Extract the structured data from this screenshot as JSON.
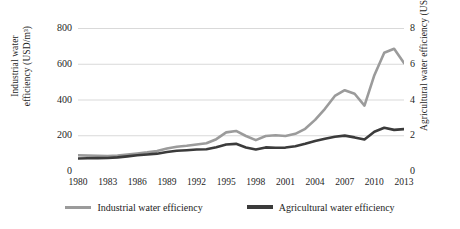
{
  "chart_data": {
    "type": "line",
    "title": "",
    "xlabel": "",
    "ylabel": "Industrial water efficiency (USD/m³)",
    "y2label": "Agricultural water efficiency (USD/m³)",
    "grid": true,
    "legend_position": "bottom",
    "x": [
      1980,
      1981,
      1982,
      1983,
      1984,
      1985,
      1986,
      1987,
      1988,
      1989,
      1990,
      1991,
      1992,
      1993,
      1994,
      1995,
      1996,
      1997,
      1998,
      1999,
      2000,
      2001,
      2002,
      2003,
      2004,
      2005,
      2006,
      2007,
      2008,
      2009,
      2010,
      2011,
      2012,
      2013
    ],
    "xtick_labels": [
      "1980",
      "1983",
      "1986",
      "1989",
      "1992",
      "1995",
      "1998",
      "2001",
      "2004",
      "2007",
      "2010",
      "2013"
    ],
    "xtick_values": [
      1980,
      1983,
      1986,
      1989,
      1992,
      1995,
      1998,
      2001,
      2004,
      2007,
      2010,
      2013
    ],
    "xlim": [
      1980,
      2013
    ],
    "ylim": [
      0,
      800
    ],
    "ytick_labels": [
      "0",
      "200",
      "400",
      "600",
      "800"
    ],
    "ytick_values": [
      0,
      200,
      400,
      600,
      800
    ],
    "y2lim": [
      0,
      8
    ],
    "y2tick_labels": [
      "0",
      "2",
      "4",
      "6",
      "8"
    ],
    "y2tick_values": [
      0,
      2,
      4,
      6,
      8
    ],
    "series": [
      {
        "name": "Industrial water efficiency",
        "axis": "left",
        "color": "#9b9b9b",
        "width": 2.6,
        "values": [
          88,
          86,
          85,
          84,
          86,
          92,
          98,
          104,
          112,
          126,
          136,
          141,
          148,
          155,
          178,
          216,
          224,
          196,
          173,
          196,
          200,
          196,
          208,
          236,
          286,
          348,
          420,
          452,
          432,
          366,
          536,
          662,
          684,
          604
        ]
      },
      {
        "name": "Agricultural water efficiency",
        "axis": "right",
        "color": "#3b3b3b",
        "width": 2.6,
        "values": [
          0.7,
          0.71,
          0.72,
          0.73,
          0.76,
          0.82,
          0.88,
          0.92,
          0.97,
          1.06,
          1.13,
          1.16,
          1.2,
          1.22,
          1.33,
          1.48,
          1.52,
          1.32,
          1.2,
          1.32,
          1.3,
          1.31,
          1.38,
          1.52,
          1.68,
          1.8,
          1.92,
          1.98,
          1.88,
          1.76,
          2.2,
          2.42,
          2.3,
          2.34
        ]
      }
    ]
  },
  "legend": {
    "items": [
      {
        "label": "Industrial water efficiency",
        "color": "#9b9b9b"
      },
      {
        "label": "Agricultural water efficiency",
        "color": "#3b3b3b"
      }
    ]
  },
  "axes": {
    "left_title_line1": "Industrial water",
    "left_title_line2": "efficiency (USD/m³)",
    "right_title": "Agricultural water efficiency (USD/m³)"
  }
}
